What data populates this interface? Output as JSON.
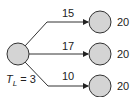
{
  "diagram": {
    "source_node": {
      "label_var": "T",
      "label_sub": "L",
      "label_eq": " = 3",
      "fill": "#d4d4d4"
    },
    "edges": [
      {
        "weight": "15",
        "target_value": "20"
      },
      {
        "weight": "17",
        "target_value": "20"
      },
      {
        "weight": "10",
        "target_value": "20"
      }
    ],
    "colors": {
      "node_fill": "#d4d4d4",
      "stroke": "#333333"
    }
  }
}
